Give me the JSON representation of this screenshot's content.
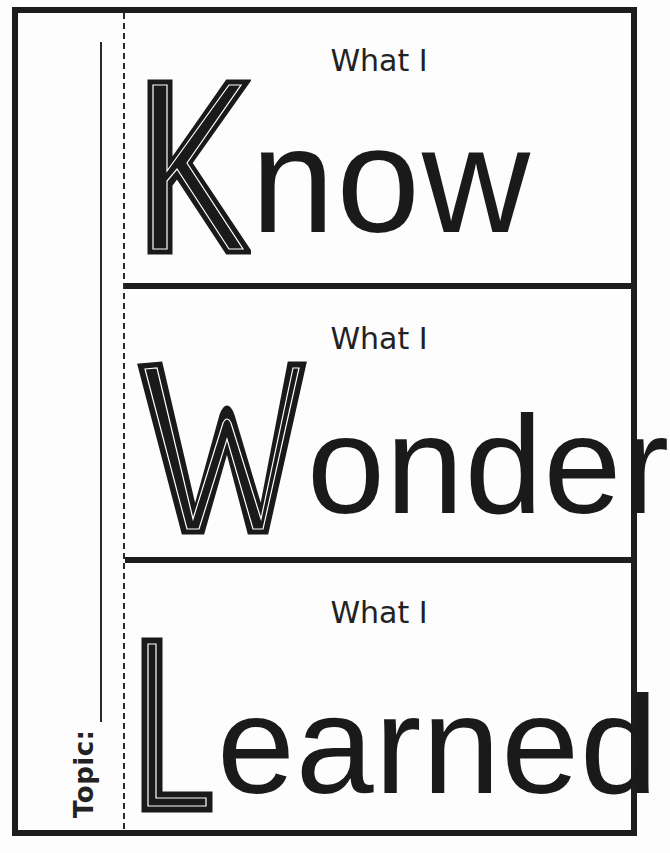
{
  "worksheet": {
    "topic_label": "Topic:",
    "sections": [
      {
        "prefix": "What I",
        "initial": "K",
        "rest": "now",
        "word": "Know"
      },
      {
        "prefix": "What I",
        "initial": "W",
        "rest": "onder",
        "word": "Wonder"
      },
      {
        "prefix": "What I",
        "initial": "L",
        "rest": "earned",
        "word": "Learned"
      }
    ]
  },
  "colors": {
    "ink": "#1d1d1d",
    "paper": "#fdfdfd"
  }
}
